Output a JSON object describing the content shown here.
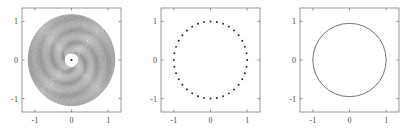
{
  "figure": {
    "title": "",
    "background_color": "#ffffff",
    "panel_count": 3,
    "axis_color": "#6e6e6e",
    "data_color": "#3a3a3a",
    "label_color": "#4a4a4a"
  },
  "axes": {
    "xticks": [
      -1,
      0,
      1
    ],
    "xticklabels": [
      "-1",
      "0",
      "1"
    ],
    "yticks": [
      -1,
      0,
      1
    ],
    "yticklabels": [
      "-1",
      "0",
      "1"
    ],
    "xlim": [
      -1.35,
      1.35
    ],
    "ylim": [
      -1.35,
      1.35
    ],
    "xlabel": "",
    "ylabel": "",
    "grid": false
  },
  "panels": [
    {
      "name": "panel-spiral-rings",
      "index": 1,
      "plot_type": "line",
      "description": "dense nested spiral rings with white circular hole at center and a single center point"
    },
    {
      "name": "panel-scatter-circle",
      "index": 2,
      "plot_type": "scatter",
      "description": "discrete sample points evenly spaced on the unit circle"
    },
    {
      "name": "panel-unit-circle",
      "index": 3,
      "plot_type": "line",
      "description": "smooth unit circle outline of radius 1"
    }
  ],
  "chart_data": [
    {
      "type": "line",
      "title": "",
      "xlabel": "",
      "ylabel": "",
      "xlim": [
        -1.35,
        1.35
      ],
      "ylim": [
        -1.35,
        1.35
      ],
      "xticks": [
        -1,
        0,
        1
      ],
      "yticks": [
        -1,
        0,
        1
      ],
      "grid": false,
      "series_description": "nested concentric rings, radii from 0.18 to 1.18, 46 rings, slight spiral perturbation",
      "ring_count": 46,
      "r_min": 0.18,
      "r_max": 1.18,
      "hole_radius": 0.18,
      "center_point": [
        0,
        0
      ]
    },
    {
      "type": "scatter",
      "title": "",
      "xlabel": "",
      "ylabel": "",
      "xlim": [
        -1.35,
        1.35
      ],
      "ylim": [
        -1.35,
        1.35
      ],
      "xticks": [
        -1,
        0,
        1
      ],
      "yticks": [
        -1,
        0,
        1
      ],
      "grid": false,
      "n_points": 36,
      "radius": 1.0,
      "marker": "point",
      "series_description": "36 evenly spaced points on the unit circle x=cos(t), y=sin(t)"
    },
    {
      "type": "line",
      "title": "",
      "xlabel": "",
      "ylabel": "",
      "xlim": [
        -1.35,
        1.35
      ],
      "ylim": [
        -1.35,
        1.35
      ],
      "xticks": [
        -1,
        0,
        1
      ],
      "yticks": [
        -1,
        0,
        1
      ],
      "grid": false,
      "radius": 1.0,
      "series_description": "continuous unit circle x=cos(t), y=sin(t)"
    }
  ]
}
